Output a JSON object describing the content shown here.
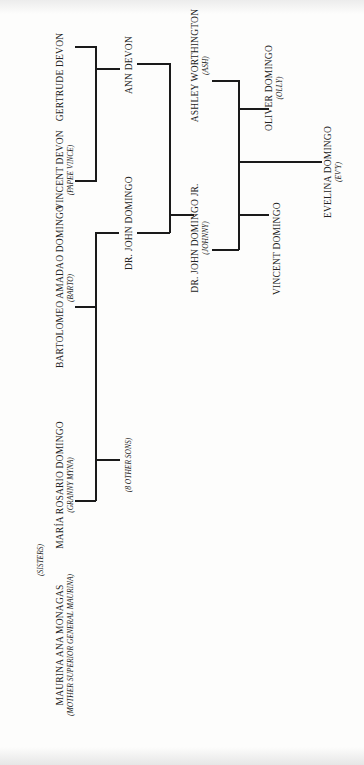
{
  "people": {
    "gertrude": {
      "name": "GERTRUDE DEVON",
      "nick": ""
    },
    "vincent_devon": {
      "name": "VINCENT DEVON",
      "nick": "(PAPEE VINCE)"
    },
    "ann": {
      "name": "ANN DEVON",
      "nick": ""
    },
    "bartolomeo": {
      "name": "BARTOLOMEO AMADAO DOMINGO",
      "nick": "(BARTO)"
    },
    "john": {
      "name": "DR. JOHN DOMINGO",
      "nick": ""
    },
    "maria": {
      "name": "MARÍA ROSARIO DOMINGO",
      "nick": "(GRANNY MYNA)"
    },
    "other_sons": {
      "name": "",
      "nick": "(8 OTHER SONS)"
    },
    "maurina": {
      "name": "MAURINA ANA MONAGAS",
      "nick": "(MOTHER SUPERIOR GENERAL MAURINA)"
    },
    "sisters": {
      "name": "",
      "nick": "(SISTERS)"
    },
    "john_jr": {
      "name": "DR. JOHN DOMINGO JR.",
      "nick": "(JOHNNY)"
    },
    "vincent_domingo": {
      "name": "VINCENT DOMINGO",
      "nick": ""
    },
    "ashley": {
      "name": "ASHLEY WORTHINGTON",
      "nick": "(ASH)"
    },
    "oliver": {
      "name": "OLIVER DOMINGO",
      "nick": "(OLLY)"
    },
    "evelina": {
      "name": "EVELINA DOMINGO",
      "nick": "(EV'Y)"
    }
  }
}
